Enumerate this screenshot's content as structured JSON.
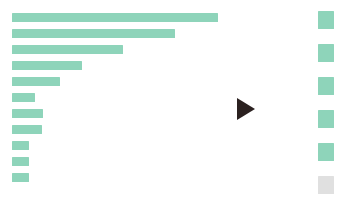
{
  "palette": {
    "background": "#ffffff",
    "bar_green": "#8ed4ba",
    "swatch_green": "#8ed4ba",
    "swatch_gray": "#e0e0e0",
    "marker_dark": "#2b2120"
  },
  "chart_data": {
    "type": "bar",
    "orientation": "horizontal",
    "title": "",
    "subtitle": "",
    "xlabel": "",
    "ylabel": "",
    "grid": false,
    "legend_position": "right",
    "categories": [
      "",
      "",
      "",
      "",
      "",
      "",
      "",
      "",
      "",
      "",
      ""
    ],
    "series": [
      {
        "name": "",
        "color": "#8ed4ba",
        "values": [
          206,
          163,
          111,
          70,
          48,
          23,
          31,
          30,
          17,
          17,
          17
        ]
      }
    ],
    "xlim": [
      0,
      206
    ],
    "bar_pixel_left": 12,
    "bar_pixel_height": 9,
    "bar_pixel_gap": 7,
    "bars": [
      {
        "index": 0,
        "label": "",
        "value": 206,
        "top": 13,
        "width": 206
      },
      {
        "index": 1,
        "label": "",
        "value": 163,
        "top": 29,
        "width": 163
      },
      {
        "index": 2,
        "label": "",
        "value": 111,
        "top": 45,
        "width": 111
      },
      {
        "index": 3,
        "label": "",
        "value": 70,
        "top": 61,
        "width": 70
      },
      {
        "index": 4,
        "label": "",
        "value": 48,
        "top": 77,
        "width": 48
      },
      {
        "index": 5,
        "label": "",
        "value": 23,
        "top": 93,
        "width": 23
      },
      {
        "index": 6,
        "label": "",
        "value": 31,
        "top": 109,
        "width": 31
      },
      {
        "index": 7,
        "label": "",
        "value": 30,
        "top": 125,
        "width": 30
      },
      {
        "index": 8,
        "label": "",
        "value": 17,
        "top": 141,
        "width": 17
      },
      {
        "index": 9,
        "label": "",
        "value": 17,
        "top": 157,
        "width": 17
      },
      {
        "index": 10,
        "label": "",
        "value": 17,
        "top": 173,
        "width": 17
      }
    ],
    "legend_swatches": [
      {
        "index": 0,
        "label": "",
        "color": "#8ed4ba",
        "top": 11,
        "state": "active"
      },
      {
        "index": 1,
        "label": "",
        "color": "#8ed4ba",
        "top": 44,
        "state": "active"
      },
      {
        "index": 2,
        "label": "",
        "color": "#8ed4ba",
        "top": 77,
        "state": "active"
      },
      {
        "index": 3,
        "label": "",
        "color": "#8ed4ba",
        "top": 110,
        "state": "active"
      },
      {
        "index": 4,
        "label": "",
        "color": "#8ed4ba",
        "top": 143,
        "state": "active"
      },
      {
        "index": 5,
        "label": "",
        "color": "#e0e0e0",
        "top": 176,
        "state": "inactive"
      }
    ]
  },
  "marker": {
    "icon": "play-triangle-icon",
    "direction": "right",
    "color": "#2b2120"
  }
}
